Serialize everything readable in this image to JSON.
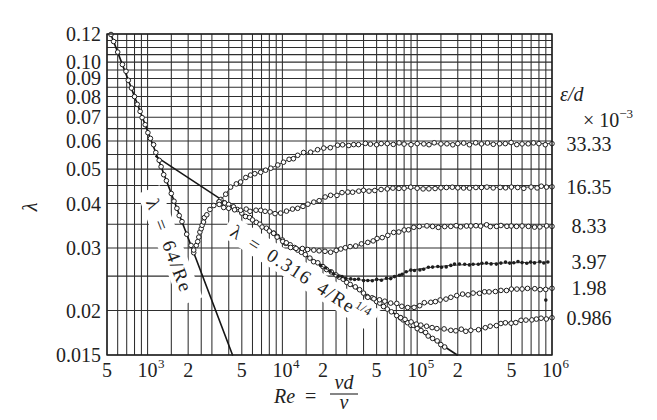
{
  "chart_data": {
    "type": "scatter",
    "title": "",
    "xlabel": "Re = vd/ν",
    "xlabel_parts": {
      "lhs": "Re",
      "eq": "=",
      "numerator": "vd",
      "denominator": "ν"
    },
    "ylabel": "λ",
    "xscale": "log",
    "yscale": "log",
    "xlim": [
      500,
      1000000
    ],
    "ylim": [
      0.015,
      0.12
    ],
    "grid": true,
    "x_grid_multipliers": [
      1,
      1.5,
      2,
      2.5,
      3,
      4,
      5,
      6,
      7,
      8,
      9
    ],
    "y_grid": [
      0.015,
      0.02,
      0.025,
      0.03,
      0.035,
      0.04,
      0.045,
      0.05,
      0.055,
      0.06,
      0.065,
      0.07,
      0.075,
      0.08,
      0.085,
      0.09,
      0.095,
      0.1,
      0.105,
      0.11,
      0.115,
      0.12
    ],
    "xticks": [
      {
        "value": 500,
        "label": "5",
        "sup": ""
      },
      {
        "value": 1000,
        "label": "10",
        "sup": "3"
      },
      {
        "value": 2000,
        "label": "2",
        "sup": ""
      },
      {
        "value": 5000,
        "label": "5",
        "sup": ""
      },
      {
        "value": 10000,
        "label": "10",
        "sup": "4"
      },
      {
        "value": 20000,
        "label": "2",
        "sup": ""
      },
      {
        "value": 50000,
        "label": "5",
        "sup": ""
      },
      {
        "value": 100000,
        "label": "10",
        "sup": "5"
      },
      {
        "value": 200000,
        "label": "2",
        "sup": ""
      },
      {
        "value": 500000,
        "label": "5",
        "sup": ""
      },
      {
        "value": 1000000,
        "label": "10",
        "sup": "6"
      }
    ],
    "yticks": [
      {
        "value": 0.12,
        "label": "0.12"
      },
      {
        "value": 0.1,
        "label": "0.10"
      },
      {
        "value": 0.09,
        "label": "0.09"
      },
      {
        "value": 0.08,
        "label": "0.08"
      },
      {
        "value": 0.07,
        "label": "0.07"
      },
      {
        "value": 0.06,
        "label": "0.06"
      },
      {
        "value": 0.05,
        "label": "0.05"
      },
      {
        "value": 0.04,
        "label": "0.04"
      },
      {
        "value": 0.03,
        "label": "0.03"
      },
      {
        "value": 0.02,
        "label": "0.02"
      },
      {
        "value": 0.015,
        "label": "0.015"
      }
    ],
    "legend": {
      "title": "ε/d",
      "unit": "× 10",
      "unit_exp": "−3",
      "position": "right",
      "entries": [
        {
          "label": "33.33",
          "series": "eps-33.33"
        },
        {
          "label": "16.35",
          "series": "eps-16.35"
        },
        {
          "label": "8.33",
          "series": "eps-8.33"
        },
        {
          "label": "3.97",
          "series": "eps-3.97"
        },
        {
          "label": "1.98",
          "series": "eps-1.98"
        },
        {
          "label": "0.986",
          "series": "eps-0.986"
        }
      ]
    },
    "reference_lines": [
      {
        "name": "laminar",
        "label": "λ = 64/Re",
        "label_sup": "",
        "formula": "λ = 64/Re",
        "coef": 64,
        "exp": -1,
        "re_range": [
          533,
          4267
        ]
      },
      {
        "name": "blasius",
        "label": "λ = 0.316 4/Re",
        "label_sup": "1/4",
        "formula": "λ = 0.3164/Re^0.25",
        "coef": 0.3164,
        "exp": -0.25,
        "re_range": [
          1150,
          198000
        ]
      }
    ],
    "series": [
      {
        "id": "laminar",
        "name": "laminar region",
        "marker": "open",
        "curve": false,
        "spacing": 7,
        "points": [
          [
            535,
            0.1196
          ],
          [
            560,
            0.1143
          ],
          [
            600,
            0.1067
          ],
          [
            650,
            0.0985
          ],
          [
            720,
            0.0889
          ],
          [
            800,
            0.08
          ],
          [
            880,
            0.0727
          ],
          [
            960,
            0.0667
          ],
          [
            1050,
            0.061
          ],
          [
            1150,
            0.0557
          ],
          [
            1260,
            0.0508
          ],
          [
            1380,
            0.0464
          ],
          [
            1500,
            0.0427
          ],
          [
            1650,
            0.0388
          ],
          [
            1800,
            0.0356
          ],
          [
            1950,
            0.0328
          ],
          [
            2100,
            0.0305
          ],
          [
            2200,
            0.0291
          ]
        ]
      },
      {
        "id": "transition",
        "name": "transition region",
        "marker": "open",
        "curve": false,
        "spacing": 3.5,
        "points": [
          [
            2200,
            0.0296
          ],
          [
            2300,
            0.0305
          ],
          [
            2400,
            0.0322
          ],
          [
            2500,
            0.034
          ],
          [
            2600,
            0.0355
          ],
          [
            2750,
            0.0372
          ],
          [
            2900,
            0.0385
          ],
          [
            3100,
            0.0395
          ],
          [
            3400,
            0.0405
          ],
          [
            3700,
            0.0402
          ]
        ]
      },
      {
        "id": "smooth",
        "name": "hydraulically smooth",
        "marker": "open",
        "curve": false,
        "spacing": 4,
        "points": [
          [
            3500,
            0.0411
          ],
          [
            4000,
            0.0398
          ],
          [
            5000,
            0.0376
          ],
          [
            6000,
            0.036
          ],
          [
            8000,
            0.0335
          ],
          [
            10000,
            0.0316
          ],
          [
            13000,
            0.0296
          ],
          [
            16000,
            0.0281
          ],
          [
            20000,
            0.0266
          ],
          [
            25000,
            0.0252
          ],
          [
            30000,
            0.024
          ],
          [
            40000,
            0.0224
          ],
          [
            50000,
            0.0212
          ],
          [
            60000,
            0.0202
          ],
          [
            75000,
            0.0191
          ],
          [
            100000,
            0.0178
          ],
          [
            130000,
            0.0167
          ],
          [
            160000,
            0.0158
          ]
        ]
      },
      {
        "id": "eps-33.33",
        "name": "ε/d = 33.33×10⁻³",
        "marker": "open",
        "curve": true,
        "spacing": 5,
        "points": [
          [
            3400,
            0.0405
          ],
          [
            3800,
            0.0425
          ],
          [
            4130,
            0.0445
          ],
          [
            4900,
            0.046
          ],
          [
            5800,
            0.0481
          ],
          [
            6900,
            0.049
          ],
          [
            8200,
            0.0503
          ],
          [
            10200,
            0.0523
          ],
          [
            13000,
            0.0547
          ],
          [
            16200,
            0.0558
          ],
          [
            20300,
            0.0573
          ],
          [
            25700,
            0.0584
          ],
          [
            33800,
            0.0586
          ],
          [
            45000,
            0.0588
          ],
          [
            60000,
            0.059
          ],
          [
            80000,
            0.0588
          ],
          [
            100000,
            0.059
          ],
          [
            150000,
            0.0589
          ],
          [
            200000,
            0.059
          ],
          [
            300000,
            0.0589
          ],
          [
            450000,
            0.059
          ],
          [
            600000,
            0.0589
          ],
          [
            800000,
            0.059
          ],
          [
            1000000,
            0.059
          ]
        ]
      },
      {
        "id": "eps-16.35",
        "name": "ε/d = 16.35×10⁻³",
        "marker": "open",
        "curve": true,
        "spacing": 5,
        "points": [
          [
            3400,
            0.0398
          ],
          [
            4000,
            0.0388
          ],
          [
            4900,
            0.0383
          ],
          [
            6900,
            0.0383
          ],
          [
            9700,
            0.0376
          ],
          [
            13000,
            0.0388
          ],
          [
            17100,
            0.0404
          ],
          [
            22800,
            0.0422
          ],
          [
            30600,
            0.0431
          ],
          [
            40000,
            0.0436
          ],
          [
            60000,
            0.044
          ],
          [
            80000,
            0.0442
          ],
          [
            100000,
            0.0442
          ],
          [
            150000,
            0.0443
          ],
          [
            200000,
            0.0443
          ],
          [
            300000,
            0.0444
          ],
          [
            500000,
            0.0445
          ],
          [
            700000,
            0.0445
          ],
          [
            1000000,
            0.0446
          ]
        ]
      },
      {
        "id": "eps-8.33",
        "name": "ε/d = 8.33×10⁻³",
        "marker": "open",
        "curve": true,
        "spacing": 5,
        "points": [
          [
            8600,
            0.033
          ],
          [
            11500,
            0.0301
          ],
          [
            17100,
            0.0296
          ],
          [
            22800,
            0.0292
          ],
          [
            27100,
            0.0298
          ],
          [
            35000,
            0.0304
          ],
          [
            43000,
            0.0311
          ],
          [
            55000,
            0.0321
          ],
          [
            67000,
            0.0332
          ],
          [
            94400,
            0.0343
          ],
          [
            130000,
            0.0345
          ],
          [
            177600,
            0.0345
          ],
          [
            250000,
            0.0346
          ],
          [
            417600,
            0.0347
          ],
          [
            600000,
            0.0346
          ],
          [
            1000000,
            0.0345
          ]
        ]
      },
      {
        "id": "eps-3.97",
        "name": "ε/d = 3.97×10⁻³",
        "marker": "filled",
        "curve": true,
        "spacing": 4,
        "points": [
          [
            19200,
            0.0268
          ],
          [
            24000,
            0.0254
          ],
          [
            29500,
            0.0246
          ],
          [
            43000,
            0.0243
          ],
          [
            63600,
            0.0246
          ],
          [
            89600,
            0.026
          ],
          [
            130000,
            0.0265
          ],
          [
            177600,
            0.0268
          ],
          [
            260000,
            0.027
          ],
          [
            417600,
            0.0272
          ],
          [
            600000,
            0.0273
          ],
          [
            933000,
            0.0274
          ]
        ]
      },
      {
        "id": "eps-1.98",
        "name": "ε/d = 1.98×10⁻³",
        "marker": "open",
        "curve": true,
        "spacing": 5,
        "points": [
          [
            43000,
            0.0218
          ],
          [
            63600,
            0.021
          ],
          [
            85100,
            0.0204
          ],
          [
            126100,
            0.0211
          ],
          [
            177600,
            0.0218
          ],
          [
            260000,
            0.0224
          ],
          [
            417600,
            0.0228
          ],
          [
            600000,
            0.023
          ],
          [
            1000000,
            0.0231
          ]
        ]
      },
      {
        "id": "eps-0.986",
        "name": "ε/d = 0.986×10⁻³",
        "marker": "open",
        "curve": true,
        "spacing": 5,
        "points": [
          [
            75500,
            0.0191
          ],
          [
            106400,
            0.0182
          ],
          [
            140000,
            0.0178
          ],
          [
            177600,
            0.0176
          ],
          [
            250000,
            0.0176
          ],
          [
            320000,
            0.0179
          ],
          [
            417600,
            0.0184
          ],
          [
            640000,
            0.0188
          ],
          [
            1000000,
            0.0191
          ]
        ]
      }
    ],
    "outliers": [
      [
        900000,
        0.0214
      ]
    ]
  }
}
